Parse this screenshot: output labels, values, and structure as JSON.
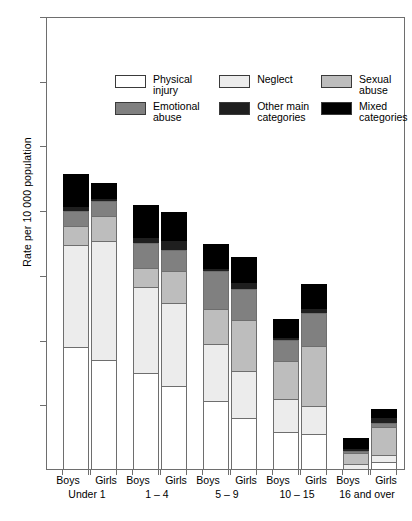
{
  "chart_data": {
    "type": "bar",
    "subtype": "stacked-bar-grouped",
    "title": "",
    "xlabel": "",
    "ylabel": "Rate per 10 000 population",
    "ylim": [
      0,
      70
    ],
    "yticks": [
      10,
      20,
      30,
      40,
      50,
      60,
      70
    ],
    "grid": false,
    "legend_position": "inside-top-left",
    "series": [
      {
        "name": "Physical injury",
        "color": "#ffffff",
        "values": [
          19.0,
          17.0,
          15.0,
          13.0,
          10.7,
          8.0,
          5.9,
          5.5,
          0.0,
          1.3
        ]
      },
      {
        "name": "Neglect",
        "color": "#ececec",
        "values": [
          16.0,
          18.5,
          13.5,
          13.0,
          9.0,
          7.5,
          5.2,
          4.5,
          1.0,
          1.1
        ]
      },
      {
        "name": "Sexual abuse",
        "color": "#bdbdbd",
        "values": [
          3.0,
          4.0,
          3.0,
          5.0,
          5.5,
          8.0,
          6.0,
          9.5,
          1.8,
          4.5
        ]
      },
      {
        "name": "Emotional abuse",
        "color": "#808080",
        "values": [
          2.5,
          2.5,
          4.0,
          3.5,
          6.0,
          5.0,
          3.4,
          5.2,
          0.5,
          0.8
        ]
      },
      {
        "name": "Other main categories",
        "color": "#1f1f1f",
        "values": [
          0.8,
          0.5,
          1.0,
          1.5,
          0.5,
          1.0,
          0.5,
          0.8,
          0.4,
          0.9
        ]
      },
      {
        "name": "Mixed categories",
        "color": "#000000",
        "values": [
          5.0,
          2.5,
          5.0,
          4.5,
          3.8,
          4.0,
          3.0,
          3.8,
          1.7,
          1.5
        ]
      }
    ],
    "categories": [
      "Boys Under 1",
      "Girls Under 1",
      "Boys 1 – 4",
      "Girls 1 – 4",
      "Boys 5 – 9",
      "Girls 5 – 9",
      "Boys 10 – 15",
      "Girls 10 – 15",
      "Boys 16 and over",
      "Girls 16 and over"
    ],
    "totals": [
      46.3,
      45.0,
      41.5,
      40.5,
      35.5,
      33.5,
      24.0,
      29.3,
      5.4,
      10.1
    ]
  },
  "axis": {
    "y_title": "Rate per 10 000 population",
    "ticks": [
      "70",
      "60",
      "50",
      "40",
      "30",
      "20",
      "10"
    ]
  },
  "legend": {
    "items": [
      {
        "label": "Physical injury",
        "key": "physical"
      },
      {
        "label": "Neglect",
        "key": "neglect"
      },
      {
        "label": "Sexual abuse",
        "key": "sexual"
      },
      {
        "label": "Emotional abuse",
        "key": "emotional"
      },
      {
        "label": "Other main\ncategories",
        "key": "other"
      },
      {
        "label": "Mixed categories",
        "key": "mixed"
      }
    ]
  },
  "groups": [
    {
      "range": "Under 1",
      "boys": "Boys",
      "girls": "Girls"
    },
    {
      "range": "1 – 4",
      "boys": "Boys",
      "girls": "Girls"
    },
    {
      "range": "5 – 9",
      "boys": "Boys",
      "girls": "Girls"
    },
    {
      "range": "10 – 15",
      "boys": "Boys",
      "girls": "Girls"
    },
    {
      "range": "16 and over",
      "boys": "Boys",
      "girls": "Girls"
    }
  ]
}
